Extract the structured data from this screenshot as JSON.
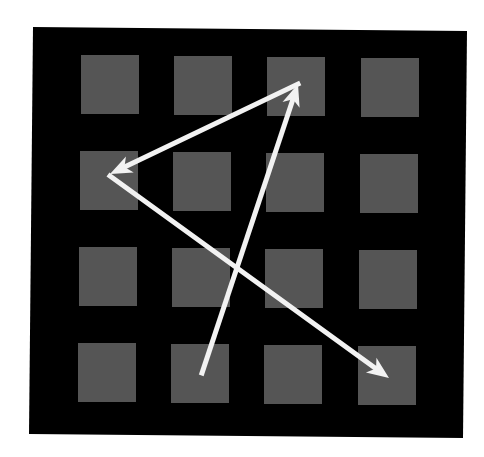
{
  "diagram": {
    "background": "#ffffff",
    "panel": {
      "color": "#000000",
      "corners": [
        [
          33,
          27
        ],
        [
          467,
          31
        ],
        [
          463,
          438
        ],
        [
          29,
          434
        ]
      ]
    },
    "grid": {
      "rows": 4,
      "cols": 4,
      "square_color": "#555555",
      "square_size": 58,
      "col_x": [
        81,
        174,
        267,
        361
      ],
      "row_y": [
        55,
        151,
        247,
        343
      ]
    },
    "arrows": {
      "color": "#f2f2f2",
      "width": 5,
      "items": [
        {
          "id": "arrow-1",
          "from": [
            202,
            373
          ],
          "to": [
            298,
            84
          ],
          "from_cell": "row4-col2",
          "to_cell": "row1-col3"
        },
        {
          "id": "arrow-2",
          "from": [
            298,
            84
          ],
          "to": [
            110,
            174
          ],
          "from_cell": "row1-col3",
          "to_cell": "row2-col1"
        },
        {
          "id": "arrow-3",
          "from": [
            110,
            176
          ],
          "to": [
            389,
            378
          ],
          "from_cell": "row2-col1",
          "to_cell": "row4-col4"
        }
      ]
    }
  }
}
